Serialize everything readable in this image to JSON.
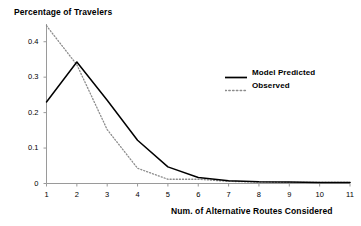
{
  "chart_data": {
    "type": "line",
    "title": "Percentage of Travelers",
    "subtitle": "",
    "xlabel": "Num. of Alternative Routes Considered",
    "ylabel": "",
    "x": [
      1,
      2,
      3,
      4,
      5,
      6,
      7,
      8,
      9,
      10,
      11
    ],
    "xticklabels": [
      "1",
      "2",
      "3",
      "4",
      "5",
      "6",
      "7",
      "8",
      "9",
      "10",
      "11"
    ],
    "yticklabels": [
      "0",
      "0.1",
      "0.2",
      "0.3",
      "0.4"
    ],
    "ytickvalues": [
      0,
      0.1,
      0.2,
      0.3,
      0.4
    ],
    "xlim": [
      1,
      11
    ],
    "ylim": [
      0,
      0.45
    ],
    "grid": false,
    "legend_position": "upper right",
    "series": [
      {
        "name": "Model Predicted",
        "style": "solid",
        "color": "#000000",
        "values": [
          0.23,
          0.343,
          0.235,
          0.122,
          0.047,
          0.017,
          0.008,
          0.005,
          0.004,
          0.003,
          0.003
        ]
      },
      {
        "name": "Observed",
        "style": "dotted",
        "color": "#808080",
        "values": [
          0.445,
          0.335,
          0.152,
          0.043,
          0.012,
          0.012,
          0.006,
          0.004,
          0.003,
          0.003,
          0.003
        ]
      }
    ]
  },
  "axes": {
    "y_ticks": [
      {
        "label": "0.4",
        "value": 0.4
      },
      {
        "label": "0.3",
        "value": 0.3
      },
      {
        "label": "0.2",
        "value": 0.2
      },
      {
        "label": "0.1",
        "value": 0.1
      },
      {
        "label": "0",
        "value": 0
      }
    ],
    "x_ticks": [
      {
        "label": "1"
      },
      {
        "label": "2"
      },
      {
        "label": "3"
      },
      {
        "label": "4"
      },
      {
        "label": "5"
      },
      {
        "label": "6"
      },
      {
        "label": "7"
      },
      {
        "label": "8"
      },
      {
        "label": "9"
      },
      {
        "label": "10"
      },
      {
        "label": "11"
      }
    ]
  },
  "legend": {
    "entries": [
      {
        "label": "Model Predicted",
        "style": "solid"
      },
      {
        "label": "Observed",
        "style": "dotted"
      }
    ]
  },
  "colors": {
    "axis": "#808080",
    "model_line": "#000000",
    "observed_line": "#8c8c8c",
    "text": "#000000",
    "background": "#ffffff"
  }
}
